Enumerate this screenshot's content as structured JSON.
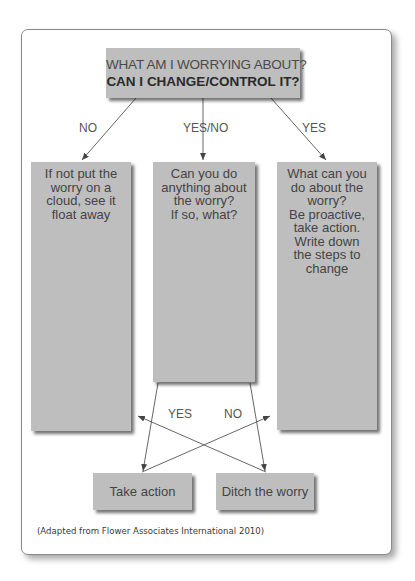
{
  "diagram": {
    "title": {
      "line1": "WHAT AM I WORRYING ABOUT?",
      "line2": "CAN I CHANGE/CONTROL IT?"
    },
    "branch_labels": {
      "left": "NO",
      "middle": "YES/NO",
      "right": "YES"
    },
    "boxes": {
      "left": [
        "If not put the",
        "worry on a",
        "cloud, see it",
        "float away"
      ],
      "middle": [
        "Can you do",
        "anything about",
        "the worry?",
        "If so, what?"
      ],
      "right": [
        "What can you",
        "do about the",
        "worry?",
        "Be proactive,",
        "take action.",
        "Write down",
        "the steps to",
        "change"
      ]
    },
    "decision_labels": {
      "yes": "YES",
      "no": "NO"
    },
    "outcomes": {
      "take_action": "Take action",
      "ditch_worry": "Ditch the worry"
    },
    "caption": "(Adapted from Flower Associates International 2010)",
    "colors": {
      "box_fill": "#bebebe",
      "text": "#444444",
      "lines": "#555555",
      "frame_border": "#8a8a8a"
    }
  }
}
